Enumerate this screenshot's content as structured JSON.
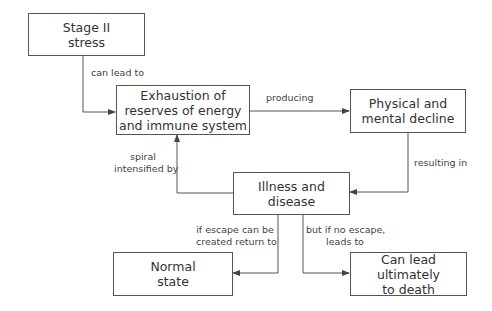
{
  "diagram": {
    "nodes": [
      {
        "id": "stage2",
        "lines": [
          "Stage II",
          "stress"
        ]
      },
      {
        "id": "exhaustion",
        "lines": [
          "Exhaustion of",
          "reserves of energy",
          "and immune system"
        ]
      },
      {
        "id": "decline",
        "lines": [
          "Physical and",
          "mental decline"
        ]
      },
      {
        "id": "illness",
        "lines": [
          "Illness and",
          "disease"
        ]
      },
      {
        "id": "normal",
        "lines": [
          "Normal",
          "state"
        ]
      },
      {
        "id": "death",
        "lines": [
          "Can lead ultimately",
          "to death"
        ]
      }
    ],
    "edges": [
      {
        "from": "stage2",
        "to": "exhaustion",
        "label_lines": [
          "can lead to"
        ]
      },
      {
        "from": "exhaustion",
        "to": "decline",
        "label_lines": [
          "producing"
        ]
      },
      {
        "from": "decline",
        "to": "illness",
        "label_lines": [
          "resulting in"
        ]
      },
      {
        "from": "illness",
        "to": "exhaustion",
        "label_lines": [
          "spiral",
          "intensified by"
        ]
      },
      {
        "from": "illness",
        "to": "normal",
        "label_lines": [
          "if escape can be",
          "created return to"
        ]
      },
      {
        "from": "illness",
        "to": "death",
        "label_lines": [
          "but if no escape,",
          "leads to"
        ]
      }
    ]
  },
  "colors": {
    "line": "#555555",
    "text": "#333333",
    "background": "#ffffff"
  }
}
